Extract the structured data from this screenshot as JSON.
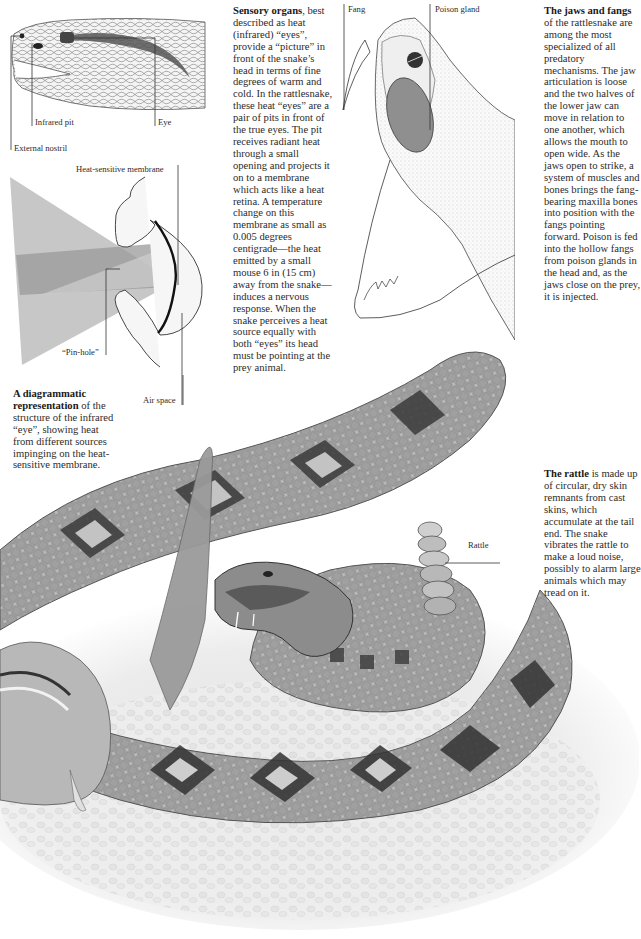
{
  "head_diagram": {
    "labels": {
      "infrared_pit": "Infrared pit",
      "eye": "Eye",
      "external_nostril": "External nostril"
    }
  },
  "infrared_eye_diagram": {
    "labels": {
      "heat_sensitive_membrane": "Heat-sensitive membrane",
      "pin_hole": "“Pin-hole”",
      "air_space": "Air space"
    },
    "caption": {
      "lead": "A diagrammatic representation",
      "text": " of the structure of the infrared “eye”, showing heat from different sources impinging on the heat-sensitive membrane."
    }
  },
  "sensory_organs": {
    "lead": "Sensory organs",
    "text": ", best described as heat (infrared) “eyes”, provide a “picture” in front of the snake’s head in terms of fine degrees of warm and cold. In the rattlesnake, these heat “eyes” are a pair of pits in front of the true eyes. The pit receives radiant heat through a small opening and projects it on to a membrane which acts like a heat retina. A temperature change on this membrane as small as 0.005 degrees centigrade—the heat emitted by a small mouse 6 in (15 cm) away from the snake—induces a nervous response. When the snake perceives a heat source equally with both “eyes” its head must be pointing at the prey animal."
  },
  "jaw_diagram": {
    "labels": {
      "fang": "Fang",
      "poison_gland": "Poison gland"
    }
  },
  "jaws_and_fangs": {
    "lead": "The jaws and fangs",
    "text": " of the rattlesnake are among the most specialized of all predatory mechanisms. The jaw articulation is loose and the two halves of the lower jaw can move in relation to one another, which allows the mouth to open wide. As the jaws open to strike, a system of muscles and bones brings the fang-bearing maxilla bones into position with the fangs pointing forward. Poison is fed into the hollow fangs from poison glands in the head and, as the jaws close on the prey, it is injected."
  },
  "rattle_section": {
    "label": "Rattle",
    "lead": "The rattle",
    "text": " is made up of circular, dry skin remnants from cast skins, which accumulate at the tail end. The snake vibrates the rattle to make a loud noise, possibly to alarm large animals which may tread on it."
  },
  "colors": {
    "ink": "#2b2b2b",
    "scale_dark": "#3a3a3a",
    "scale_mid": "#8a8a8a",
    "scale_light": "#d8d8d8",
    "heat_beam": "#a9a9a9",
    "poison_gland": "#8f8f8f",
    "ground": "#e6e6e6"
  }
}
